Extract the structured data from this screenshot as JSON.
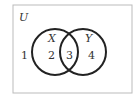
{
  "diagram": {
    "type": "venn",
    "universe_label": "U",
    "sets": [
      {
        "label": "X"
      },
      {
        "label": "Y"
      }
    ],
    "regions": {
      "outside": "1",
      "x_only": "2",
      "intersection": "3",
      "y_only": "4"
    },
    "colors": {
      "stroke": "#222222",
      "frame": "#bbbbbb",
      "text": "#333333"
    }
  }
}
